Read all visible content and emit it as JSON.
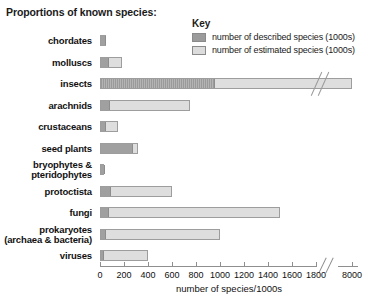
{
  "title": "Proportions of known species:",
  "key": {
    "heading": "Key",
    "items": [
      {
        "label": "number of described species (1000s)",
        "swatch": "described",
        "color": "#9b9b9b"
      },
      {
        "label": "number of estimated species (1000s)",
        "swatch": "estimated",
        "color": "#dcdcdc"
      }
    ]
  },
  "axis": {
    "title": "number of species/1000s",
    "ticks": [
      "0",
      "200",
      "400",
      "600",
      "800",
      "1000",
      "1200",
      "1400",
      "1600",
      "1800",
      "8000"
    ],
    "has_break": true,
    "break_after": "1800"
  },
  "chart_data": {
    "type": "bar",
    "orientation": "horizontal",
    "title": "Proportions of known species:",
    "xlabel": "number of species/1000s",
    "ylabel": "",
    "xlim": [
      0,
      8000
    ],
    "axis_break": {
      "from": 1900,
      "to": 7800
    },
    "grid": false,
    "legend_position": "top-right",
    "categories": [
      "chordates",
      "molluscs",
      "insects",
      "arachnids",
      "crustaceans",
      "seed plants",
      "bryophytes & pteridophytes",
      "protoctista",
      "fungi",
      "prokaryotes (archaea & bacteria)",
      "viruses"
    ],
    "series": [
      {
        "name": "number of described species (1000s)",
        "color": "#9b9b9b",
        "values": [
          45,
          70,
          950,
          75,
          40,
          270,
          30,
          80,
          70,
          40,
          5
        ]
      },
      {
        "name": "number of estimated species (1000s)",
        "color": "#dcdcdc",
        "values": [
          50,
          180,
          8000,
          750,
          150,
          320,
          30,
          600,
          1500,
          1000,
          400
        ]
      }
    ]
  },
  "rows": [
    {
      "label": "chordates",
      "line2": "",
      "described": 45,
      "estimated": 50
    },
    {
      "label": "molluscs",
      "line2": "",
      "described": 70,
      "estimated": 180
    },
    {
      "label": "insects",
      "line2": "",
      "described": 950,
      "estimated": 8000
    },
    {
      "label": "arachnids",
      "line2": "",
      "described": 75,
      "estimated": 750
    },
    {
      "label": "crustaceans",
      "line2": "",
      "described": 40,
      "estimated": 150
    },
    {
      "label": "seed plants",
      "line2": "",
      "described": 270,
      "estimated": 320
    },
    {
      "label": "bryophytes &",
      "line2": "pteridophytes",
      "described": 30,
      "estimated": 30
    },
    {
      "label": "protoctista",
      "line2": "",
      "described": 80,
      "estimated": 600
    },
    {
      "label": "fungi",
      "line2": "",
      "described": 70,
      "estimated": 1500
    },
    {
      "label": "prokaryotes",
      "line2": "(archaea & bacteria)",
      "described": 40,
      "estimated": 1000
    },
    {
      "label": "viruses",
      "line2": "",
      "described": 5,
      "estimated": 400
    }
  ]
}
